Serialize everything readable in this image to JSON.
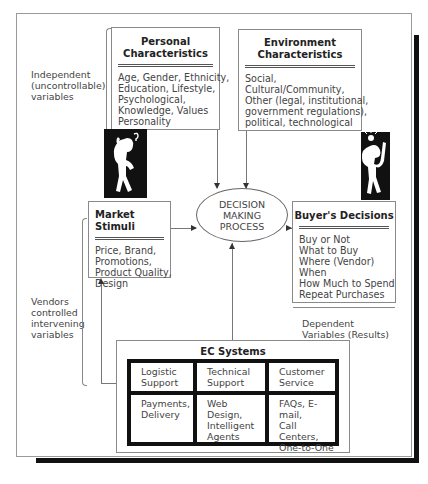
{
  "diagram": {
    "independent_label": [
      "Independent",
      "(uncontrollable)",
      "variables"
    ],
    "vendors_label": [
      "Vendors",
      "controlled",
      "intervening",
      "variables"
    ],
    "dependent_label": [
      "Dependent",
      "Variables (Results)"
    ],
    "personal": {
      "title": [
        "Personal",
        "Characteristics"
      ],
      "items": [
        "Age, Gender, Ethnicity,",
        "Education, Lifestyle,",
        "Psychological,",
        "Knowledge, Values",
        "Personality"
      ]
    },
    "environment": {
      "title": [
        "Environment",
        "Characteristics"
      ],
      "items": [
        "Social,",
        "Cultural/Community,",
        "Other (legal, institutional,",
        "government regulations),",
        "political, technological"
      ]
    },
    "market": {
      "title": "Market Stimuli",
      "items": [
        "Price, Brand,",
        "Promotions,",
        "Product Quality,",
        "Design"
      ]
    },
    "decision": {
      "lines": [
        "DECISION",
        "MAKING",
        "PROCESS"
      ]
    },
    "buyer": {
      "title": "Buyer's Decisions",
      "items": [
        "Buy or Not",
        "What to Buy",
        "Where (Vendor)",
        "When",
        "How Much to Spend",
        "Repeat Purchases"
      ]
    },
    "ec": {
      "title": "EC Systems",
      "cells": [
        [
          "Logistic",
          "Support"
        ],
        [
          "Technical",
          "Support"
        ],
        [
          "Customer",
          "Service"
        ],
        [
          "Payments,",
          "Delivery"
        ],
        [
          "Web Design,",
          "Intelligent",
          "Agents"
        ],
        [
          "FAQs, E-mail,",
          "Call Centers,",
          "One-to-One"
        ]
      ]
    },
    "figures": [
      "thinking-person-figure",
      "idea-person-figure"
    ]
  }
}
